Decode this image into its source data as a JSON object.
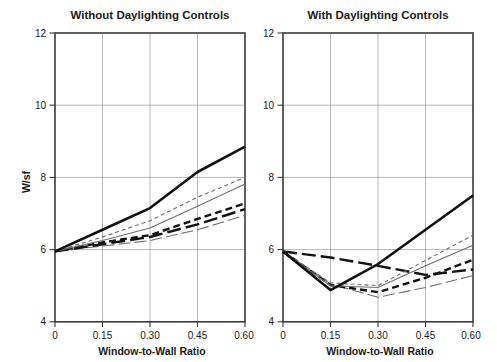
{
  "figure": {
    "width": 497,
    "height": 362,
    "background": "#ffffff",
    "ink_color": "#1a1a1a",
    "grid_color": "#9a9a9a",
    "frame_color": "#3a3a3a"
  },
  "axes": {
    "ylabel": "W/sf",
    "xlabel_left": "Window-to-Wall Ratio",
    "xlabel_right": "Window-to-Wall Ratio",
    "y_ticks": [
      "4",
      "6",
      "8",
      "10",
      "12"
    ],
    "x_ticks": [
      "0",
      "0.15",
      "0.30",
      "0.45",
      "0.60"
    ],
    "ylim": [
      4,
      12
    ],
    "xlim": [
      0,
      0.6
    ]
  },
  "chart_data": [
    {
      "type": "line",
      "title": "Without Daylighting Controls",
      "xlabel": "Window-to-Wall Ratio",
      "ylabel": "W/sf",
      "x": [
        0,
        0.15,
        0.3,
        0.45,
        0.6
      ],
      "xlim": [
        0,
        0.6
      ],
      "ylim": [
        4,
        12
      ],
      "grid": true,
      "legend": "none",
      "series": [
        {
          "name": "series-1-thick-solid",
          "style": "thick-solid",
          "color": "#111111",
          "width": 2.6,
          "dash": "none",
          "values": [
            5.95,
            6.55,
            7.15,
            8.15,
            8.85
          ]
        },
        {
          "name": "series-2-thin-dashed-light",
          "style": "thin-short-dash",
          "color": "#6f6f6f",
          "width": 1.1,
          "dash": "4,3",
          "values": [
            5.95,
            6.35,
            6.8,
            7.45,
            8.0
          ]
        },
        {
          "name": "series-3-thin-solid",
          "style": "thin-solid",
          "color": "#6f6f6f",
          "width": 1.1,
          "dash": "none",
          "values": [
            5.95,
            6.25,
            6.6,
            7.2,
            7.82
          ]
        },
        {
          "name": "series-4-thick-short-dash",
          "style": "thick-short-dash",
          "color": "#111111",
          "width": 2.4,
          "dash": "7,4",
          "values": [
            5.95,
            6.2,
            6.4,
            6.85,
            7.28
          ]
        },
        {
          "name": "series-5-thick-long-dash",
          "style": "thick-long-dash",
          "color": "#111111",
          "width": 2.4,
          "dash": "14,5",
          "values": [
            5.95,
            6.15,
            6.35,
            6.7,
            7.12
          ]
        },
        {
          "name": "series-6-thin-long-dash",
          "style": "thin-long-dash",
          "color": "#6f6f6f",
          "width": 1.1,
          "dash": "12,4",
          "values": [
            5.95,
            6.1,
            6.25,
            6.55,
            6.95
          ]
        }
      ]
    },
    {
      "type": "line",
      "title": "With Daylighting Controls",
      "xlabel": "Window-to-Wall Ratio",
      "ylabel": "W/sf",
      "x": [
        0,
        0.15,
        0.3,
        0.45,
        0.6
      ],
      "xlim": [
        0,
        0.6
      ],
      "ylim": [
        4,
        12
      ],
      "grid": true,
      "legend": "none",
      "series": [
        {
          "name": "series-1-thick-solid",
          "style": "thick-solid",
          "color": "#111111",
          "width": 2.6,
          "dash": "none",
          "values": [
            5.95,
            4.88,
            5.6,
            6.55,
            7.5
          ]
        },
        {
          "name": "series-2-thin-dashed-light",
          "style": "thin-short-dash",
          "color": "#6f6f6f",
          "width": 1.1,
          "dash": "4,3",
          "values": [
            5.95,
            5.08,
            5.0,
            5.7,
            6.4
          ]
        },
        {
          "name": "series-3-thin-solid",
          "style": "thin-solid",
          "color": "#6f6f6f",
          "width": 1.1,
          "dash": "none",
          "values": [
            5.95,
            5.0,
            4.95,
            5.55,
            6.12
          ]
        },
        {
          "name": "series-4-thick-short-dash",
          "style": "thick-short-dash",
          "color": "#111111",
          "width": 2.4,
          "dash": "7,4",
          "values": [
            5.95,
            5.02,
            4.82,
            5.22,
            5.72
          ]
        },
        {
          "name": "series-5-thick-long-dash",
          "style": "thick-long-dash",
          "color": "#111111",
          "width": 2.4,
          "dash": "14,5",
          "values": [
            5.95,
            5.78,
            5.55,
            5.3,
            5.45
          ]
        },
        {
          "name": "series-6-thin-long-dash",
          "style": "thin-long-dash",
          "color": "#6f6f6f",
          "width": 1.1,
          "dash": "12,4",
          "values": [
            5.95,
            5.05,
            4.68,
            4.95,
            5.28
          ]
        }
      ]
    }
  ]
}
